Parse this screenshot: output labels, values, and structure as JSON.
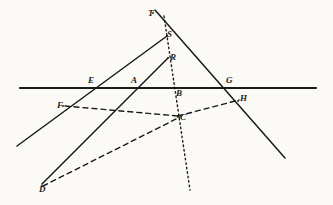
{
  "figure": {
    "width": 333,
    "height": 205,
    "background_color": "#fbfaf6",
    "ink_color": "#1a1a18"
  },
  "points": [
    {
      "id": "T",
      "label": "T",
      "x": 153,
      "y": 13,
      "label_x": 148,
      "label_y": 9
    },
    {
      "id": "S",
      "label": "S",
      "x": 167,
      "y": 36,
      "label_x": 167,
      "label_y": 30
    },
    {
      "id": "R",
      "label": "R",
      "x": 168,
      "y": 58,
      "label_x": 170,
      "label_y": 53
    },
    {
      "id": "E",
      "label": "E",
      "x": 95,
      "y": 88,
      "label_x": 88,
      "label_y": 76
    },
    {
      "id": "A",
      "label": "A",
      "x": 137,
      "y": 88,
      "label_x": 131,
      "label_y": 76
    },
    {
      "id": "B",
      "label": "B",
      "x": 176,
      "y": 88,
      "label_x": 176,
      "label_y": 89
    },
    {
      "id": "G",
      "label": "G",
      "x": 228,
      "y": 88,
      "label_x": 226,
      "label_y": 76
    },
    {
      "id": "H",
      "label": "H",
      "x": 238,
      "y": 101,
      "label_x": 240,
      "label_y": 94
    },
    {
      "id": "F",
      "label": "F",
      "x": 63,
      "y": 106,
      "label_x": 57,
      "label_y": 101
    },
    {
      "id": "C",
      "label": "C",
      "x": 178,
      "y": 117,
      "label_x": 180,
      "label_y": 113
    },
    {
      "id": "D",
      "label": "D",
      "x": 42,
      "y": 186,
      "label_x": 39,
      "label_y": 185
    }
  ],
  "lines": [
    {
      "id": "horizontal-baseline",
      "name": "horizontal-baseline",
      "style": "solid",
      "width": 2.1,
      "from": {
        "x": 20,
        "y": 88
      },
      "to": {
        "x": 316,
        "y": 88
      }
    },
    {
      "id": "line-S-to-lower-left",
      "name": "line-through-S-and-E",
      "style": "solid",
      "width": 1.5,
      "from": {
        "x": 167,
        "y": 36
      },
      "to": {
        "x": 17,
        "y": 146
      }
    },
    {
      "id": "line-T-to-lower-right",
      "name": "line-through-T-G-H",
      "style": "solid",
      "width": 1.5,
      "from": {
        "x": 155,
        "y": 10
      },
      "to": {
        "x": 285,
        "y": 158
      }
    },
    {
      "id": "line-D-to-R",
      "name": "line-from-D-through-A-to-R",
      "style": "solid",
      "width": 1.5,
      "from": {
        "x": 42,
        "y": 184
      },
      "to": {
        "x": 168,
        "y": 58
      }
    },
    {
      "id": "dotted-axis",
      "name": "dotted-vertical-axis-T-to-bottom",
      "style": "dotted",
      "width": 1.4,
      "dash": "1.5 3",
      "from": {
        "x": 164,
        "y": 16
      },
      "to": {
        "x": 190,
        "y": 190
      }
    },
    {
      "id": "dashed-F-to-C",
      "name": "dashed-segment-F-to-C",
      "style": "dashed",
      "width": 1.4,
      "dash": "5 4",
      "from": {
        "x": 65,
        "y": 106
      },
      "to": {
        "x": 178,
        "y": 116
      }
    },
    {
      "id": "dashed-C-to-H",
      "name": "dashed-segment-C-to-H",
      "style": "dashed",
      "width": 1.4,
      "dash": "5 4",
      "from": {
        "x": 178,
        "y": 116
      },
      "to": {
        "x": 239,
        "y": 100
      }
    },
    {
      "id": "dashed-D-to-C",
      "name": "dashed-segment-D-to-C",
      "style": "dashed",
      "width": 1.4,
      "dash": "5 4",
      "from": {
        "x": 43,
        "y": 186
      },
      "to": {
        "x": 180,
        "y": 117
      }
    }
  ]
}
